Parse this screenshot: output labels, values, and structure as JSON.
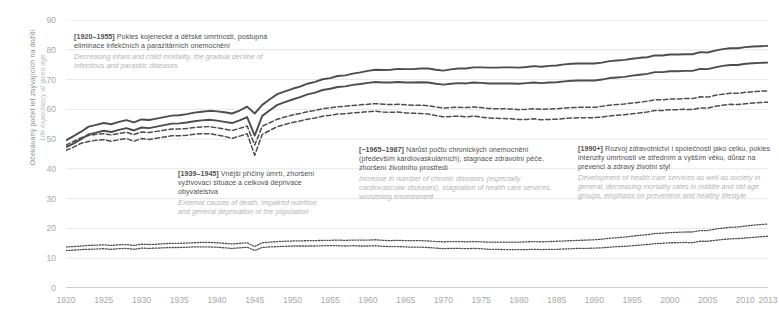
{
  "axes": {
    "y_label_cz": "Očekávaný počet let zbývajících na dožití",
    "y_label_en": "Life expectancy at given age",
    "y_ticks": [
      0,
      10,
      20,
      30,
      40,
      50,
      60,
      70,
      80,
      90
    ],
    "x_ticks": [
      1920,
      1925,
      1930,
      1935,
      1940,
      1945,
      1950,
      1955,
      1960,
      1965,
      1970,
      1975,
      1980,
      1985,
      1990,
      1995,
      2000,
      2005,
      2010,
      2013
    ]
  },
  "annotations": [
    {
      "id": "a1",
      "tag": "[1920–1955]",
      "cz": "Pokles kojenecké a dětské úmrtnosti, postupná eliminace infekčních a parazitárních onemocnění",
      "en": "Decreasing infant and child mortality, the gradual decline of infectious and parasitic diseases"
    },
    {
      "id": "a2",
      "tag": "[1939–1945]",
      "cz": "Vnější příčiny úmrtí, zhoršení vyživovací situace a celková deprivace obyvatelstva",
      "en": "External causes of death, impaired nutrition and general deprivation of the population"
    },
    {
      "id": "a3",
      "tag": "[~1965–1987]",
      "cz": "Nárůst počtu chronických onemocnění (především kardiovaskulárních), stagnace zdravotní péče, zhoršení životního prostředí",
      "en": "Increase in number of chronic diseases (especially cardiovascular diseases), stagnation of health care services, worsening environment"
    },
    {
      "id": "a4",
      "tag": "[1990+]",
      "cz": "Rozvoj zdravotnictví i společnosti jako celku, pokles intenzity úmrtnosti ve středním a vyšším věku, důraz na prevenci a zdravý životní styl",
      "en": "Development of health care services as well as society in general, decreasing mortality rates in middle and old age groups, emphasis on prevention and healthy lifestyle"
    }
  ],
  "colors": {
    "line": "#4d4d4d",
    "grid": "#e6e6e6",
    "tick_text": "#a8a8a8",
    "anno_cz": "#4f4f4f",
    "anno_en": "#b3b3b3"
  },
  "chart_data": {
    "type": "line",
    "title": "",
    "xlabel": "",
    "ylabel": "Očekávaný počet let zbývajících na dožití / Life expectancy at given age",
    "xlim": [
      1920,
      2013
    ],
    "ylim": [
      0,
      90
    ],
    "grid": true,
    "legend": "none",
    "x": [
      1920,
      1921,
      1922,
      1923,
      1924,
      1925,
      1926,
      1927,
      1928,
      1929,
      1930,
      1931,
      1932,
      1933,
      1934,
      1935,
      1936,
      1937,
      1938,
      1939,
      1940,
      1941,
      1942,
      1943,
      1944,
      1945,
      1946,
      1947,
      1948,
      1949,
      1950,
      1951,
      1952,
      1953,
      1954,
      1955,
      1956,
      1957,
      1958,
      1959,
      1960,
      1961,
      1962,
      1963,
      1964,
      1965,
      1966,
      1967,
      1968,
      1969,
      1970,
      1971,
      1972,
      1973,
      1974,
      1975,
      1976,
      1977,
      1978,
      1979,
      1980,
      1981,
      1982,
      1983,
      1984,
      1985,
      1986,
      1987,
      1988,
      1989,
      1990,
      1991,
      1992,
      1993,
      1994,
      1995,
      1996,
      1997,
      1998,
      1999,
      2000,
      2001,
      2002,
      2003,
      2004,
      2005,
      2006,
      2007,
      2008,
      2009,
      2010,
      2011,
      2012,
      2013
    ],
    "series": [
      {
        "name": "Life expectancy at birth – women",
        "style": "solid",
        "width": 1.9,
        "values": [
          49.6,
          51.0,
          52.5,
          54.2,
          54.8,
          55.4,
          55.0,
          55.8,
          56.4,
          55.6,
          56.6,
          56.4,
          56.9,
          57.4,
          57.9,
          58.0,
          58.4,
          58.9,
          59.2,
          59.5,
          59.3,
          59.0,
          58.6,
          59.6,
          60.9,
          58.6,
          61.5,
          63.4,
          65.1,
          66.0,
          66.9,
          67.6,
          68.6,
          69.2,
          70.1,
          70.5,
          71.2,
          71.4,
          72.0,
          72.4,
          72.9,
          73.3,
          73.2,
          73.3,
          73.6,
          73.5,
          73.5,
          73.7,
          73.7,
          73.3,
          73.0,
          73.4,
          73.7,
          73.7,
          74.1,
          74.1,
          74.0,
          74.0,
          74.1,
          74.1,
          74.0,
          74.2,
          74.5,
          74.3,
          74.6,
          74.7,
          75.1,
          75.3,
          75.4,
          75.4,
          75.4,
          75.7,
          76.2,
          76.4,
          76.6,
          77.0,
          77.3,
          77.5,
          78.1,
          78.1,
          78.4,
          78.4,
          78.5,
          78.5,
          79.2,
          79.1,
          79.7,
          80.2,
          80.5,
          80.5,
          80.9,
          81.1,
          81.2,
          81.3
        ]
      },
      {
        "name": "Life expectancy at birth – total",
        "style": "solid",
        "width": 1.9,
        "values": [
          47.3,
          48.5,
          50.0,
          51.6,
          52.2,
          52.8,
          52.4,
          53.1,
          53.7,
          52.9,
          53.9,
          53.7,
          54.2,
          54.7,
          55.2,
          55.3,
          55.6,
          56.0,
          56.3,
          56.5,
          56.2,
          55.8,
          55.4,
          56.3,
          57.4,
          51.2,
          57.8,
          59.7,
          61.5,
          62.4,
          63.3,
          64.1,
          65.0,
          65.6,
          66.5,
          66.9,
          67.5,
          67.7,
          68.2,
          68.5,
          68.9,
          69.2,
          69.0,
          69.0,
          69.2,
          69.0,
          69.0,
          69.1,
          69.0,
          68.6,
          68.3,
          68.6,
          68.8,
          68.7,
          69.0,
          68.9,
          68.7,
          68.7,
          68.7,
          68.7,
          68.6,
          68.8,
          69.0,
          68.8,
          69.0,
          69.1,
          69.4,
          69.6,
          69.7,
          69.7,
          69.7,
          70.0,
          70.5,
          70.7,
          70.9,
          71.3,
          71.6,
          71.9,
          72.5,
          72.5,
          72.8,
          72.8,
          72.9,
          72.9,
          73.6,
          73.5,
          74.1,
          74.6,
          74.9,
          74.9,
          75.3,
          75.5,
          75.6,
          75.7
        ]
      },
      {
        "name": "Life expectancy at birth – men",
        "style": "dashed",
        "width": 1.5,
        "values": [
          48.0,
          49.2,
          50.5,
          51.2,
          51.6,
          51.8,
          51.4,
          51.9,
          52.3,
          51.5,
          52.4,
          52.2,
          52.6,
          53.0,
          53.4,
          53.4,
          53.6,
          53.9,
          54.1,
          54.2,
          53.8,
          53.4,
          52.9,
          53.6,
          54.4,
          48.0,
          54.3,
          55.5,
          56.7,
          57.4,
          58.1,
          58.6,
          59.2,
          59.6,
          60.2,
          60.5,
          60.9,
          61.0,
          61.3,
          61.5,
          61.7,
          61.9,
          61.7,
          61.6,
          61.7,
          61.5,
          61.4,
          61.4,
          61.2,
          60.8,
          60.4,
          60.6,
          60.7,
          60.6,
          60.8,
          60.6,
          60.3,
          60.2,
          60.2,
          60.1,
          59.9,
          60.0,
          60.2,
          60.0,
          60.1,
          60.2,
          60.4,
          60.6,
          60.7,
          60.7,
          60.7,
          61.0,
          61.4,
          61.6,
          61.8,
          62.1,
          62.4,
          62.7,
          63.2,
          63.2,
          63.5,
          63.5,
          63.6,
          63.6,
          64.2,
          64.1,
          64.7,
          65.1,
          65.4,
          65.4,
          65.7,
          65.9,
          66.1,
          66.2
        ]
      },
      {
        "name": "Life expectancy at birth – men (alt.)",
        "style": "dashed",
        "width": 1.5,
        "values": [
          46.2,
          47.3,
          48.6,
          49.2,
          49.6,
          49.8,
          49.3,
          49.8,
          50.2,
          49.3,
          50.2,
          49.9,
          50.3,
          50.7,
          51.1,
          51.1,
          51.3,
          51.6,
          51.8,
          51.8,
          51.4,
          50.9,
          50.3,
          51.0,
          51.8,
          44.6,
          51.6,
          52.9,
          54.2,
          54.9,
          55.6,
          56.1,
          56.7,
          57.1,
          57.7,
          58.0,
          58.4,
          58.5,
          58.8,
          59.0,
          59.2,
          59.4,
          59.1,
          59.0,
          59.1,
          58.8,
          58.7,
          58.6,
          58.4,
          57.9,
          57.5,
          57.6,
          57.7,
          57.5,
          57.7,
          57.4,
          57.1,
          57.0,
          56.9,
          56.8,
          56.6,
          56.6,
          56.8,
          56.5,
          56.6,
          56.7,
          56.9,
          57.1,
          57.2,
          57.2,
          57.2,
          57.4,
          57.8,
          58.0,
          58.2,
          58.5,
          58.8,
          59.1,
          59.6,
          59.6,
          59.9,
          59.9,
          60.0,
          59.9,
          60.5,
          60.4,
          61.0,
          61.4,
          61.7,
          61.6,
          61.9,
          62.1,
          62.3,
          62.4
        ]
      },
      {
        "name": "Life expectancy at age 65 – women",
        "style": "dotted",
        "width": 1.3,
        "values": [
          13.8,
          13.9,
          14.1,
          14.3,
          14.4,
          14.5,
          14.3,
          14.5,
          14.6,
          14.3,
          14.7,
          14.6,
          14.7,
          14.9,
          15.0,
          15.0,
          15.1,
          15.2,
          15.3,
          15.3,
          15.2,
          15.0,
          14.8,
          15.0,
          15.2,
          13.9,
          15.2,
          15.4,
          15.6,
          15.7,
          15.8,
          15.8,
          15.9,
          15.9,
          16.0,
          16.0,
          16.1,
          16.0,
          16.1,
          16.1,
          16.1,
          16.2,
          16.0,
          15.9,
          16.0,
          15.9,
          15.9,
          15.9,
          15.8,
          15.6,
          15.5,
          15.6,
          15.6,
          15.5,
          15.6,
          15.5,
          15.4,
          15.4,
          15.4,
          15.4,
          15.4,
          15.5,
          15.6,
          15.5,
          15.6,
          15.7,
          15.8,
          15.9,
          16.0,
          16.1,
          16.2,
          16.4,
          16.7,
          16.9,
          17.1,
          17.4,
          17.7,
          17.9,
          18.3,
          18.4,
          18.6,
          18.7,
          18.8,
          18.8,
          19.3,
          19.3,
          19.8,
          20.1,
          20.4,
          20.5,
          20.8,
          21.1,
          21.3,
          21.5
        ]
      },
      {
        "name": "Life expectancy at age 65 – men",
        "style": "dotted",
        "width": 1.3,
        "values": [
          12.6,
          12.7,
          12.9,
          13.0,
          13.1,
          13.2,
          13.0,
          13.2,
          13.3,
          13.0,
          13.4,
          13.3,
          13.4,
          13.5,
          13.6,
          13.6,
          13.7,
          13.8,
          13.8,
          13.8,
          13.7,
          13.5,
          13.3,
          13.5,
          13.7,
          12.6,
          13.6,
          13.8,
          13.9,
          14.0,
          14.1,
          14.1,
          14.1,
          14.1,
          14.2,
          14.2,
          14.2,
          14.1,
          14.2,
          14.1,
          14.1,
          14.2,
          14.0,
          13.9,
          13.9,
          13.8,
          13.7,
          13.7,
          13.6,
          13.4,
          13.2,
          13.3,
          13.3,
          13.2,
          13.3,
          13.2,
          13.0,
          13.0,
          12.9,
          12.9,
          12.9,
          12.9,
          13.0,
          12.9,
          13.0,
          13.0,
          13.1,
          13.2,
          13.3,
          13.3,
          13.4,
          13.5,
          13.7,
          13.9,
          14.0,
          14.2,
          14.4,
          14.6,
          14.9,
          15.0,
          15.2,
          15.2,
          15.3,
          15.2,
          15.7,
          15.7,
          16.0,
          16.3,
          16.5,
          16.6,
          16.8,
          17.0,
          17.2,
          17.4
        ]
      }
    ]
  }
}
